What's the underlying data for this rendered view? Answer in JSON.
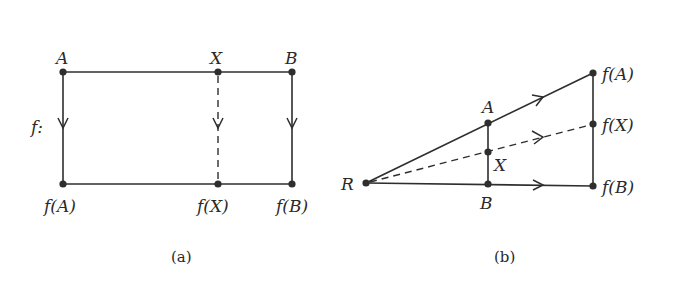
{
  "figure": {
    "panel_a": {
      "caption": "(a)",
      "map_label": "f:",
      "points": {
        "A": {
          "label": "A",
          "x": 63,
          "y": 72
        },
        "X": {
          "label": "X",
          "x": 218,
          "y": 72
        },
        "B": {
          "label": "B",
          "x": 292,
          "y": 72
        },
        "fA": {
          "label": "f(A)",
          "x": 63,
          "y": 184
        },
        "fX": {
          "label": "f(X)",
          "x": 218,
          "y": 184
        },
        "fB": {
          "label": "f(B)",
          "x": 292,
          "y": 184
        }
      }
    },
    "panel_b": {
      "caption": "(b)",
      "points": {
        "R": {
          "label": "R",
          "x": 366,
          "y": 183
        },
        "A": {
          "label": "A",
          "x": 488,
          "y": 123
        },
        "X": {
          "label": "X",
          "x": 488,
          "y": 152
        },
        "B": {
          "label": "B",
          "x": 488,
          "y": 184
        },
        "fA": {
          "label": "f(A)",
          "x": 593,
          "y": 73
        },
        "fX": {
          "label": "f(X)",
          "x": 593,
          "y": 124
        },
        "fB": {
          "label": "f(B)",
          "x": 593,
          "y": 186
        }
      }
    },
    "colors": {
      "ink": "#2e2e2e",
      "background": "#ffffff"
    }
  }
}
